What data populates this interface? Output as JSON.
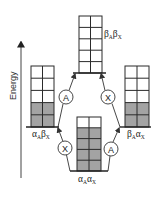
{
  "diagram": {
    "type": "energy-level-diagram",
    "axis": {
      "label": "Energy",
      "direction": "up"
    },
    "states": [
      {
        "id": "bAbX",
        "label": "βAβX",
        "label_main_1": "β",
        "label_sub_1": "A",
        "label_main_2": "β",
        "label_sub_2": "X",
        "position": "top",
        "rows": 5,
        "cols": 2,
        "grey_rows_from_bottom": 0
      },
      {
        "id": "aAbX",
        "label": "αAβX",
        "label_main_1": "α",
        "label_sub_1": "A",
        "label_main_2": "β",
        "label_sub_2": "X",
        "position": "left",
        "rows": 5,
        "cols": 2,
        "grey_rows_from_bottom": 2
      },
      {
        "id": "bAaX",
        "label": "βAαX",
        "label_main_1": "β",
        "label_sub_1": "A",
        "label_main_2": "α",
        "label_sub_2": "X",
        "position": "right",
        "rows": 5,
        "cols": 2,
        "grey_rows_from_bottom": 2
      },
      {
        "id": "aAaX",
        "label": "αAαX",
        "label_main_1": "α",
        "label_sub_1": "A",
        "label_main_2": "α",
        "label_sub_2": "X",
        "position": "bottom",
        "rows": 5,
        "cols": 2,
        "grey_rows_from_bottom": 4
      }
    ],
    "transitions": [
      {
        "from": "aAbX",
        "to": "bAbX",
        "nucleus": "A"
      },
      {
        "from": "bAaX",
        "to": "bAbX",
        "nucleus": "X"
      },
      {
        "from": "aAaX",
        "to": "aAbX",
        "nucleus": "X"
      },
      {
        "from": "aAaX",
        "to": "bAaX",
        "nucleus": "A"
      }
    ],
    "transition_labels": {
      "upper_left": "A",
      "upper_right": "X",
      "lower_left": "X",
      "lower_right": "A"
    },
    "colors": {
      "filled_cell": "#a3a3a3",
      "empty_cell": "#ffffff",
      "lines": "#2b2b2b"
    }
  }
}
